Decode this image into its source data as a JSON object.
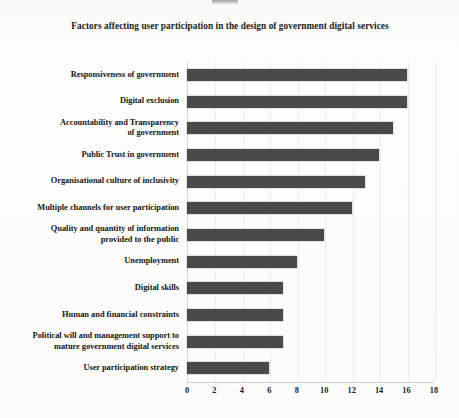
{
  "chart_data": {
    "type": "bar",
    "orientation": "horizontal",
    "title": "Factors affecting user participation in the design of government digital services",
    "xlabel": "",
    "ylabel": "",
    "xlim": [
      0,
      18
    ],
    "xticks": [
      "0",
      "2",
      "4",
      "6",
      "8",
      "10",
      "12",
      "14",
      "16",
      "18"
    ],
    "grid": true,
    "legend": "none",
    "bar_color": "#4a4a4a",
    "categories": [
      "Responsiveness of government",
      "Digital exclusion",
      "Accountability and Transparency of government",
      "Public Trust in government",
      "Organisational culture of inclusivity",
      "Multiple channels for user participation",
      "Quality and quantity of information provided to the public",
      "Unemployment",
      "Digital skills",
      "Human and financial constraints",
      "Political will and management support to mature government digital services",
      "User participation strategy"
    ],
    "category_lines": [
      [
        "Responsiveness of government"
      ],
      [
        "Digital exclusion"
      ],
      [
        "Accountability and Transparency",
        "of government"
      ],
      [
        "Public Trust in government"
      ],
      [
        "Organisational culture of inclusivity"
      ],
      [
        "Multiple channels for user participation"
      ],
      [
        "Quality and quantity of information",
        "provided to the public"
      ],
      [
        "Unemployment"
      ],
      [
        "Digital skills"
      ],
      [
        "Human and financial constraints"
      ],
      [
        "Political will and management support to",
        "mature government digital services"
      ],
      [
        "User participation strategy"
      ]
    ],
    "values": [
      16,
      16,
      15,
      14,
      13,
      12,
      10,
      8,
      7,
      7,
      7,
      6
    ]
  }
}
